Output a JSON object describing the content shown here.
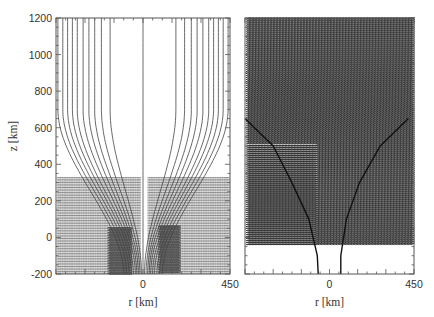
{
  "chart_data": [
    {
      "type": "line",
      "panel": "left",
      "description": "Field lines (contours) fanning out with height above a central column; velocity-vector arrows below z≈330 km",
      "xlabel": "r [km]",
      "ylabel": "z [km]",
      "xlim": [
        -450,
        450
      ],
      "ylim": [
        -200,
        1200
      ],
      "x_tick_labels": [
        "0",
        "450"
      ],
      "y_tick_labels": [
        "-200",
        "0",
        "200",
        "400",
        "600",
        "800",
        "1000",
        "1200"
      ],
      "x_ticks": [
        0,
        450
      ],
      "y_ticks": [
        -200,
        0,
        200,
        400,
        600,
        800,
        1000,
        1200
      ],
      "field_line_footpoints_r": [
        -100,
        -85,
        -72,
        -60,
        -50,
        -40,
        -32,
        -24,
        -16,
        -8,
        0,
        8,
        16,
        24,
        32,
        40,
        50,
        60,
        72,
        85,
        100
      ],
      "field_line_top_r": [
        -440,
        -415,
        -390,
        -365,
        -340,
        -310,
        -280,
        -250,
        -215,
        -170,
        0,
        170,
        215,
        250,
        280,
        310,
        340,
        365,
        390,
        415,
        440
      ],
      "vector_field_top_z": 330,
      "grid": false
    },
    {
      "type": "scatter",
      "panel": "right",
      "description": "Dense vector-arrow field over the domain with two bounding curves of a flux tube; empty region at the bottom",
      "xlabel": "r [km]",
      "xlim": [
        -450,
        450
      ],
      "ylim": [
        -200,
        1200
      ],
      "x_tick_labels": [
        "0",
        "450"
      ],
      "x_ticks": [
        0,
        450
      ],
      "boundary_left": [
        [
          -60,
          -200
        ],
        [
          -65,
          -100
        ],
        [
          -110,
          100
        ],
        [
          -200,
          300
        ],
        [
          -300,
          500
        ],
        [
          -450,
          650
        ]
      ],
      "boundary_right": [
        [
          60,
          -200
        ],
        [
          60,
          -100
        ],
        [
          90,
          100
        ],
        [
          160,
          300
        ],
        [
          270,
          500
        ],
        [
          420,
          650
        ]
      ],
      "vector_field_bottom_z": -40,
      "grid": false
    }
  ]
}
